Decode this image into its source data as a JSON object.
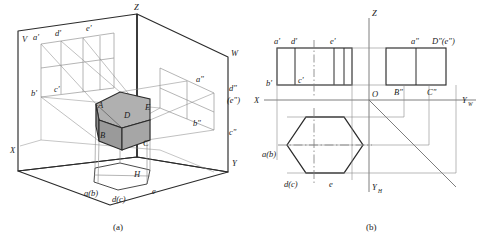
{
  "figure": {
    "panel_a": {
      "caption": "(a)",
      "plane_labels": {
        "V": "V",
        "H": "H",
        "W": "W"
      },
      "axes": {
        "x": "X",
        "y": "Y",
        "z": "Z"
      },
      "solid_vertices": {
        "A": "A",
        "B": "B",
        "C": "C",
        "D": "D",
        "E": "E"
      },
      "front_projection_labels": [
        "a'",
        "d'",
        "e'",
        "b'",
        "c'"
      ],
      "side_projection_labels": [
        "a\"",
        "d\"",
        "(e\")",
        "b\"",
        "c\""
      ],
      "top_projection_labels": [
        "a(b)",
        "d(c)",
        "e"
      ],
      "colors": {
        "solid_top_face": "#b0b0b0",
        "solid_left_face": "#9a9a9a",
        "solid_right_face": "#a4a4a4",
        "plane_outline": "#2b2b2b",
        "projector_line": "#7d7d7d"
      }
    },
    "panel_b": {
      "caption": "(b)",
      "axes": {
        "x": "X",
        "z": "Z",
        "origin": "O",
        "y_w": "Y",
        "y_w_sub": "W",
        "y_h": "Y",
        "y_h_sub": "H"
      },
      "front_view_labels": [
        "a'",
        "d'",
        "e'",
        "b'",
        "c'"
      ],
      "side_view_labels": [
        "a\"",
        "D\"(e\")",
        "B\"",
        "C\""
      ],
      "top_view_labels": [
        "a(b)",
        "d(c)",
        "e"
      ],
      "colors": {
        "outline": "#2b2b2b",
        "thin_line": "#8a8a8a",
        "center_line": "#7a7a7a"
      }
    }
  }
}
